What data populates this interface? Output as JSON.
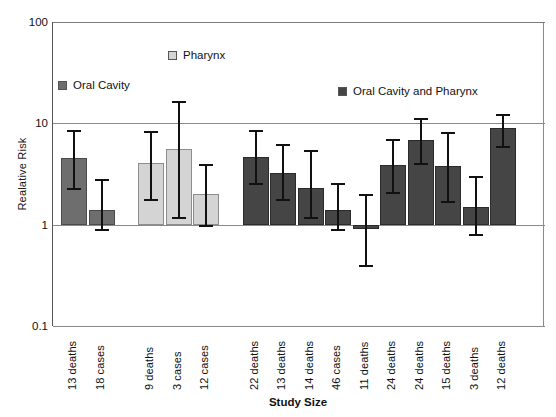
{
  "chart_data": {
    "type": "bar",
    "title": "",
    "xlabel": "Study Size",
    "ylabel": "Realative Risk",
    "yscale": "log",
    "ylim": [
      0.1,
      100
    ],
    "ytick_labels": [
      "100",
      "10",
      "1",
      "0.1"
    ],
    "ytick_values": [
      100,
      10,
      1,
      0.1
    ],
    "grid": true,
    "legend_position": "inside-top",
    "categories": [
      "13 deaths",
      "18 cases",
      "9 deaths",
      "3 cases",
      "12 cases",
      "22 deaths",
      "13 deaths",
      "14 deaths",
      "46 cases",
      "11 deaths",
      "24 deaths",
      "24 deaths",
      "15 deaths",
      "3 deaths",
      "12 deaths"
    ],
    "series": [
      {
        "name": "Oral Cavity",
        "color": "#6e6e6e",
        "points": [
          {
            "category": "13 deaths",
            "value": 4.6,
            "ci_low": 2.3,
            "ci_high": 8.5
          },
          {
            "category": "18 cases",
            "value": 1.4,
            "ci_low": 0.9,
            "ci_high": 2.8
          }
        ]
      },
      {
        "name": "Pharynx",
        "color": "#d4d4d4",
        "points": [
          {
            "category": "9 deaths",
            "value": 4.1,
            "ci_low": 1.8,
            "ci_high": 8.4
          },
          {
            "category": "3 cases",
            "value": 5.6,
            "ci_low": 1.2,
            "ci_high": 16.5
          },
          {
            "category": "12 cases",
            "value": 2.0,
            "ci_low": 1.0,
            "ci_high": 4.0
          }
        ]
      },
      {
        "name": "Oral Cavity and Pharynx",
        "color": "#454545",
        "points": [
          {
            "category": "22 deaths",
            "value": 4.7,
            "ci_low": 2.6,
            "ci_high": 8.6
          },
          {
            "category": "13 deaths",
            "value": 3.2,
            "ci_low": 1.8,
            "ci_high": 6.3
          },
          {
            "category": "14 deaths",
            "value": 2.3,
            "ci_low": 1.2,
            "ci_high": 5.5
          },
          {
            "category": "46 cases",
            "value": 1.4,
            "ci_low": 0.9,
            "ci_high": 2.6
          },
          {
            "category": "11 deaths",
            "value": 0.9,
            "ci_low": 0.4,
            "ci_high": 2.0
          },
          {
            "category": "24 deaths",
            "value": 3.9,
            "ci_low": 2.1,
            "ci_high": 7.0
          },
          {
            "category": "24 deaths",
            "value": 6.9,
            "ci_low": 4.1,
            "ci_high": 11.2
          },
          {
            "category": "15 deaths",
            "value": 3.8,
            "ci_low": 1.7,
            "ci_high": 8.3
          },
          {
            "category": "3 deaths",
            "value": 1.5,
            "ci_low": 0.8,
            "ci_high": 3.0
          },
          {
            "category": "12 deaths",
            "value": 8.9,
            "ci_low": 6.0,
            "ci_high": 12.5
          }
        ]
      }
    ]
  },
  "axes": {
    "y_title": "Realative Risk",
    "x_title": "Study Size",
    "y_ticks": [
      {
        "label": "100",
        "value": 100
      },
      {
        "label": "10",
        "value": 10
      },
      {
        "label": "1",
        "value": 1
      },
      {
        "label": "0.1",
        "value": 0.1
      }
    ]
  },
  "legend": {
    "oral": {
      "label": "Oral Cavity",
      "color": "#6e6e6e"
    },
    "pharynx": {
      "label": "Pharynx",
      "color": "#d4d4d4"
    },
    "both": {
      "label": "Oral Cavity and Pharynx",
      "color": "#454545"
    }
  }
}
